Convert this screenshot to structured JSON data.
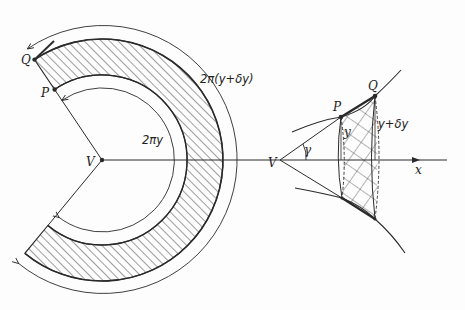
{
  "figure": {
    "left_panel": {
      "labels": {
        "Q": "Q",
        "P": "P",
        "V": "V",
        "inner_arc": "2πy",
        "outer_arc": "2π(y+δy)"
      }
    },
    "right_panel": {
      "labels": {
        "P": "P",
        "Q": "Q",
        "V": "V",
        "angle": "γ",
        "radius_p": "y",
        "radius_q": "y+δy",
        "axis": "x"
      }
    },
    "colors": {
      "ink": "#2a2a2a",
      "background": "#fdfdfd"
    }
  }
}
